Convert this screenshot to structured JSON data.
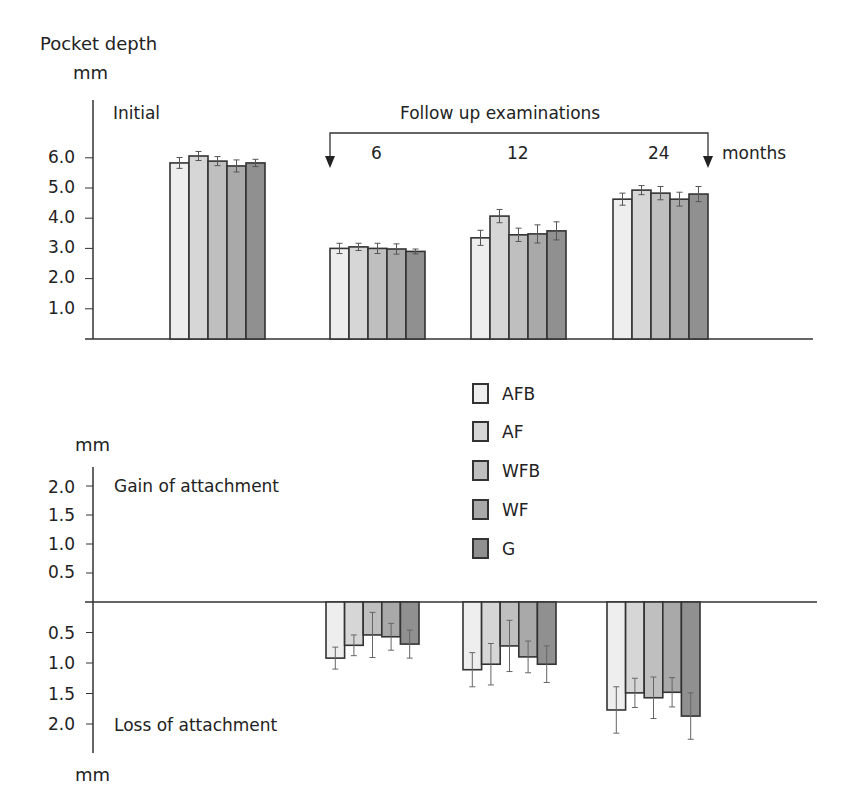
{
  "figure_tag": "(a)",
  "top_panel": {
    "ylabel_line1": "Pocket depth",
    "ylabel_line2": "mm",
    "initial_label": "Initial",
    "followup_label": "Follow up examinations",
    "months_label": "months",
    "group_labels": [
      "6",
      "12",
      "24"
    ],
    "yticks": [
      "6.0",
      "5.0",
      "4.0",
      "3.0",
      "2.0",
      "1.0"
    ]
  },
  "bottom_panel": {
    "ylabel_top": "mm",
    "ylabel_bottom": "mm",
    "gain_label": "Gain of attachment",
    "loss_label": "Loss of attachment",
    "yticks_gain": [
      "2.0",
      "1.5",
      "1.0",
      "0.5"
    ],
    "yticks_loss": [
      "0.5",
      "1.0",
      "1.5",
      "2.0"
    ]
  },
  "legend": [
    {
      "label": "AFB",
      "color": "#eeeeee"
    },
    {
      "label": "AF",
      "color": "#d6d6d6"
    },
    {
      "label": "WFB",
      "color": "#bfbfbf"
    },
    {
      "label": "WF",
      "color": "#a9a9a9"
    },
    {
      "label": "G",
      "color": "#909090"
    }
  ],
  "chart_data": [
    {
      "type": "bar",
      "title": "Pocket depth",
      "ylabel": "Pocket depth (mm)",
      "xlabel": "Follow up examinations (months)",
      "categories": [
        "Initial",
        "6",
        "12",
        "24"
      ],
      "ylim": [
        0,
        7
      ],
      "grid": false,
      "legend_position": "between panels",
      "series": [
        {
          "name": "AFB",
          "values": [
            5.83,
            3.0,
            3.35,
            4.63
          ],
          "error": [
            0.18,
            0.17,
            0.25,
            0.2
          ]
        },
        {
          "name": "AF",
          "values": [
            6.06,
            3.05,
            4.07,
            4.93
          ],
          "error": [
            0.15,
            0.12,
            0.22,
            0.15
          ]
        },
        {
          "name": "WFB",
          "values": [
            5.89,
            3.0,
            3.45,
            4.83
          ],
          "error": [
            0.15,
            0.17,
            0.22,
            0.22
          ]
        },
        {
          "name": "WF",
          "values": [
            5.73,
            2.98,
            3.48,
            4.63
          ],
          "error": [
            0.2,
            0.17,
            0.3,
            0.23
          ]
        },
        {
          "name": "G",
          "values": [
            5.83,
            2.9,
            3.58,
            4.8
          ],
          "error": [
            0.12,
            0.08,
            0.3,
            0.25
          ]
        }
      ]
    },
    {
      "type": "bar",
      "title": "Attachment level change",
      "ylabel": "mm (gain above, loss below)",
      "categories": [
        "6",
        "12",
        "24"
      ],
      "ylim": [
        -2.5,
        2.2
      ],
      "grid": false,
      "annotations": [
        "Gain of attachment",
        "Loss of attachment"
      ],
      "series": [
        {
          "name": "AFB",
          "values": [
            -0.92,
            -1.11,
            -1.77
          ],
          "error": [
            0.18,
            0.28,
            0.38
          ]
        },
        {
          "name": "AF",
          "values": [
            -0.71,
            -1.02,
            -1.49
          ],
          "error": [
            0.17,
            0.34,
            0.24
          ]
        },
        {
          "name": "WFB",
          "values": [
            -0.54,
            -0.72,
            -1.57
          ],
          "error": [
            0.37,
            0.42,
            0.34
          ]
        },
        {
          "name": "WF",
          "values": [
            -0.57,
            -0.9,
            -1.48
          ],
          "error": [
            0.22,
            0.26,
            0.24
          ]
        },
        {
          "name": "G",
          "values": [
            -0.69,
            -1.02,
            -1.87
          ],
          "error": [
            0.23,
            0.3,
            0.38
          ]
        }
      ]
    }
  ]
}
